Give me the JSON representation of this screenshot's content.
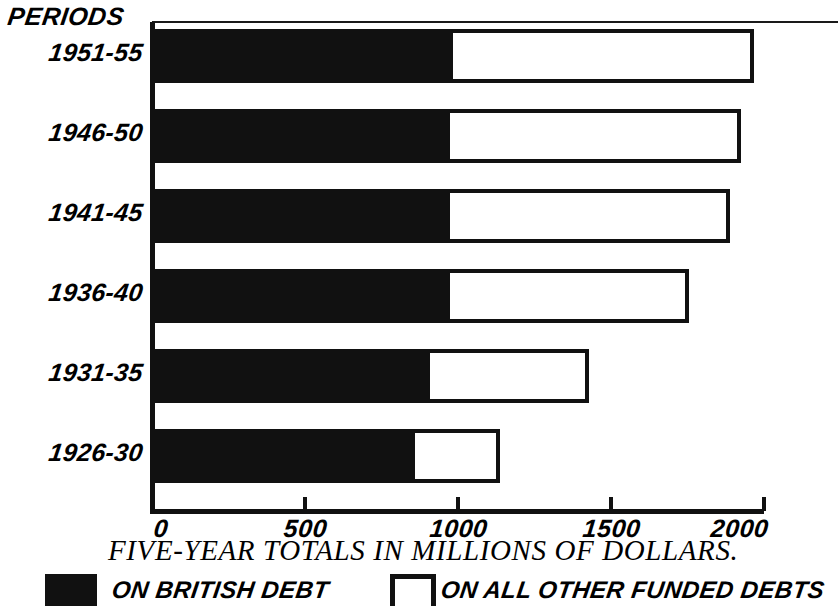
{
  "chart_data": {
    "type": "bar",
    "orientation": "horizontal",
    "stacked": true,
    "title": "",
    "xlabel": "FIVE-YEAR TOTALS IN MILLIONS OF DOLLARS.",
    "ylabel": "PERIODS",
    "categories": [
      "1951-55",
      "1946-50",
      "1941-45",
      "1936-40",
      "1931-35",
      "1926-30"
    ],
    "series": [
      {
        "name": "ON BRITISH DEBT",
        "color": "#111111",
        "values": [
          980,
          970,
          970,
          970,
          905,
          855
        ]
      },
      {
        "name": "ON ALL OTHER FUNDED DEBTS",
        "color": "#ffffff",
        "values": [
          985,
          950,
          915,
          780,
          520,
          280
        ]
      }
    ],
    "totals": [
      1965,
      1920,
      1885,
      1750,
      1425,
      1135
    ],
    "xlim": [
      0,
      2000
    ],
    "xticks": [
      0,
      500,
      1000,
      1500,
      2000
    ],
    "xtick_labels": [
      "0",
      "500",
      "1000",
      "1500",
      "2000"
    ],
    "grid": false,
    "legend_position": "bottom"
  },
  "axis": {
    "y_heading": "PERIODS",
    "x_title": "FIVE-YEAR TOTALS IN MILLIONS OF DOLLARS.",
    "ticks": [
      {
        "label": "0",
        "value": 0
      },
      {
        "label": "500",
        "value": 500
      },
      {
        "label": "1000",
        "value": 1000
      },
      {
        "label": "1500",
        "value": 1500
      },
      {
        "label": "2000",
        "value": 2000
      }
    ]
  },
  "rows": [
    {
      "label": "1951-55",
      "british": 980,
      "other": 985,
      "total": 1965
    },
    {
      "label": "1946-50",
      "british": 970,
      "other": 950,
      "total": 1920
    },
    {
      "label": "1941-45",
      "british": 970,
      "other": 915,
      "total": 1885
    },
    {
      "label": "1936-40",
      "british": 970,
      "other": 780,
      "total": 1750
    },
    {
      "label": "1931-35",
      "british": 905,
      "other": 520,
      "total": 1425
    },
    {
      "label": "1926-30",
      "british": 855,
      "other": 280,
      "total": 1135
    }
  ],
  "legend": {
    "filled_label": "ON BRITISH DEBT",
    "open_label": "ON ALL OTHER FUNDED DEBTS",
    "filled_color": "#111111",
    "open_color": "#ffffff"
  },
  "colors": {
    "ink": "#111111",
    "paper": "#ffffff"
  }
}
